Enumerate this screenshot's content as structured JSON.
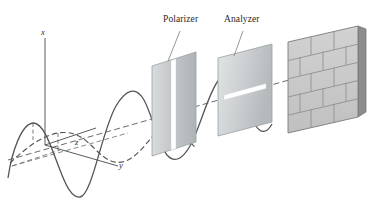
{
  "figure": {
    "background_color": "#ffffff",
    "stroke_color": "#555555",
    "panel_color": "#c0c4c6",
    "brick_color": "#c8c8c8",
    "mortar_color": "#8e8e8e"
  },
  "axes": {
    "x_label": "x",
    "y_label": "y",
    "z_label": "z"
  },
  "devices": [
    {
      "label": "Polarizer",
      "slit_orientation": "vertical",
      "transmits": "x-polarized (vertical) component"
    },
    {
      "label": "Analyzer",
      "slit_orientation": "horizontal",
      "transmits": "z-polarized (horizontal) component"
    }
  ],
  "screen": {
    "name": "brick-wall",
    "rows": 5,
    "pattern": "running bond"
  },
  "waves": [
    {
      "name": "vertical-polarized-wave",
      "style": "solid",
      "plane": "x (vertical)",
      "extent": "source through polarizer, stops at analyzer"
    },
    {
      "name": "horizontal-polarized-wave",
      "style": "dashed",
      "plane": "z (horizontal)",
      "extent": "source, absorbed at polarizer"
    },
    {
      "name": "propagation-axis",
      "style": "dashed",
      "plane": "along y",
      "extent": "source to brick wall"
    }
  ]
}
